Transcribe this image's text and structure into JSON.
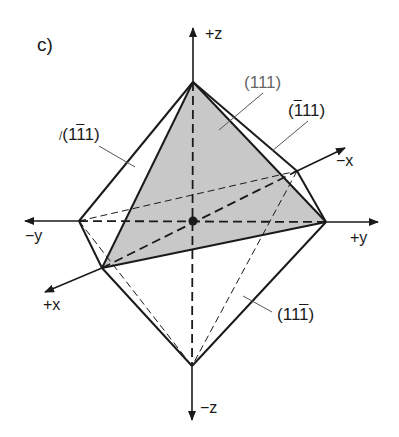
{
  "panel_label": "c)",
  "axes": {
    "plus_z": "+z",
    "minus_z": "−z",
    "plus_y": "+y",
    "minus_y": "−y",
    "plus_x": "+x",
    "minus_x": "−x"
  },
  "planes": {
    "p111": {
      "pre": "(",
      "a": "1",
      "b": "1",
      "c": "1",
      "post": ")"
    },
    "p_bar1_1_1": {
      "pre": "(",
      "a": "1",
      "b": "1",
      "c": "1",
      "post": ")"
    },
    "p_1_bar1_1": {
      "tick": "/",
      "pre": "(",
      "a": "1",
      "b": "1",
      "c": "1",
      "post": ")"
    },
    "p_1_1_bar1": {
      "pre": "(",
      "a": "1",
      "b": "1",
      "c": "1",
      "post": ")"
    }
  },
  "colors": {
    "line": "#1a1a1a",
    "shade": "#c8c8c8",
    "background": "#ffffff"
  }
}
